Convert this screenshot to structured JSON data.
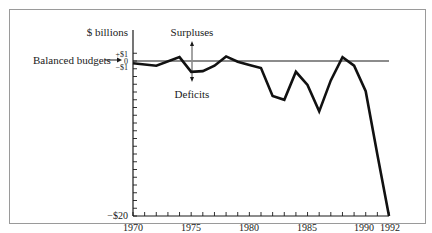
{
  "chart_data": {
    "type": "line",
    "title": "",
    "ylabel": "$ billions",
    "xlabel": "",
    "x": [
      1970,
      1972,
      1974,
      1975,
      1976,
      1977,
      1978,
      1979,
      1980,
      1981,
      1982,
      1983,
      1984,
      1985,
      1986,
      1987,
      1988,
      1989,
      1990,
      1991,
      1992
    ],
    "series": [
      {
        "name": "Budget balance",
        "values": [
          -0.3,
          -0.6,
          0.5,
          -1.4,
          -1.3,
          -0.6,
          0.6,
          -0.1,
          -0.5,
          -0.9,
          -4.5,
          -5.0,
          -1.4,
          -3.1,
          -6.5,
          -2.5,
          0.5,
          -0.6,
          -3.9,
          -12.1,
          -20.0
        ]
      }
    ],
    "xlim": [
      1970,
      1992
    ],
    "ylim": [
      -20,
      1
    ],
    "x_tick_labels": [
      "1970",
      "1975",
      "1980",
      "1985",
      "1990",
      "1992"
    ],
    "x_tick_values": [
      1970,
      1975,
      1980,
      1985,
      1990,
      1992
    ],
    "y_tick_labels": [
      "+$1",
      "0",
      "−$1",
      "−$20"
    ],
    "y_tick_values": [
      1,
      0,
      -1,
      -20
    ],
    "grid": false,
    "legend": null,
    "reference_line": {
      "value": 0,
      "label": "Balanced budgets"
    },
    "annotations": [
      {
        "text": "Surpluses",
        "direction": "up"
      },
      {
        "text": "Deficits",
        "direction": "down"
      },
      {
        "text": "Balanced budgets",
        "arrow": "right"
      }
    ]
  },
  "labels": {
    "ylabel": "$ billions",
    "surpluses": "Surpluses",
    "deficits": "Deficits",
    "balanced": "Balanced budgets",
    "plus1": "+$1",
    "zero": "0",
    "minus1": "−$1",
    "minus20": "−$20",
    "x1970": "1970",
    "x1975": "1975",
    "x1980": "1980",
    "x1985": "1985",
    "x1990": "1990",
    "x1992": "1992"
  }
}
